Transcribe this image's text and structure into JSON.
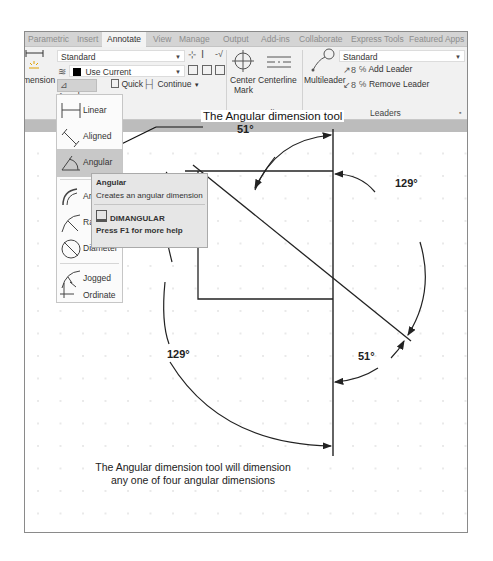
{
  "ribbon": {
    "tabs": [
      {
        "label": "Parametric",
        "active": false
      },
      {
        "label": "Insert",
        "active": false
      },
      {
        "label": "Annotate",
        "active": true
      },
      {
        "label": "View",
        "active": false
      },
      {
        "label": "Manage",
        "active": false
      },
      {
        "label": "Output",
        "active": false
      },
      {
        "label": "Add-ins",
        "active": false
      },
      {
        "label": "Collaborate",
        "active": false
      },
      {
        "label": "Express Tools",
        "active": false
      },
      {
        "label": "Featured Apps",
        "active": false
      }
    ],
    "dimensions": {
      "big_button_label": "mension",
      "style_dropdown": "Standard",
      "layer_dropdown": "Use Current",
      "angular_split_button": "Angular",
      "quick_button": "Quick",
      "continue_button": "Continue",
      "group_label": "ons"
    },
    "centerlines": {
      "center_mark_line1": "Center",
      "center_mark_line2": "Mark",
      "centerline_button": "Centerline",
      "group_label": "Centerlines"
    },
    "leaders": {
      "multileader_button": "Multileader",
      "style_dropdown": "Standard",
      "add_leader": "Add Leader",
      "remove_leader": "Remove Leader",
      "group_label": "Leaders"
    }
  },
  "dimension_menu": {
    "items": [
      {
        "label": "Linear",
        "icon": "linear-dim-icon",
        "selected": false
      },
      {
        "label": "Aligned",
        "icon": "aligned-dim-icon",
        "selected": false
      },
      {
        "label": "Angular",
        "icon": "angular-dim-icon",
        "selected": true
      },
      {
        "label": "Arc Le",
        "icon": "arc-length-icon",
        "selected": false
      },
      {
        "label": "Radiu",
        "icon": "radius-icon",
        "selected": false
      },
      {
        "label": "Diameter",
        "icon": "diameter-icon",
        "selected": false
      },
      {
        "label": "Jogged",
        "icon": "jogged-icon",
        "selected": false
      },
      {
        "label": "Ordinate",
        "icon": "ordinate-icon",
        "selected": false
      }
    ]
  },
  "tooltip": {
    "title": "Angular",
    "description": "Creates an angular dimension",
    "command": "DIMANGULAR",
    "help": "Press F1 for more help"
  },
  "drawing": {
    "callout": "The Angular dimension tool",
    "dimensions": [
      {
        "label": "51°",
        "position": "top"
      },
      {
        "label": "129°",
        "position": "right"
      },
      {
        "label": "51°",
        "position": "bottom-right"
      },
      {
        "label": "129°",
        "position": "left"
      }
    ],
    "caption_line1": "The Angular dimension tool will dimension",
    "caption_line2": "any one of four angular dimensions"
  }
}
